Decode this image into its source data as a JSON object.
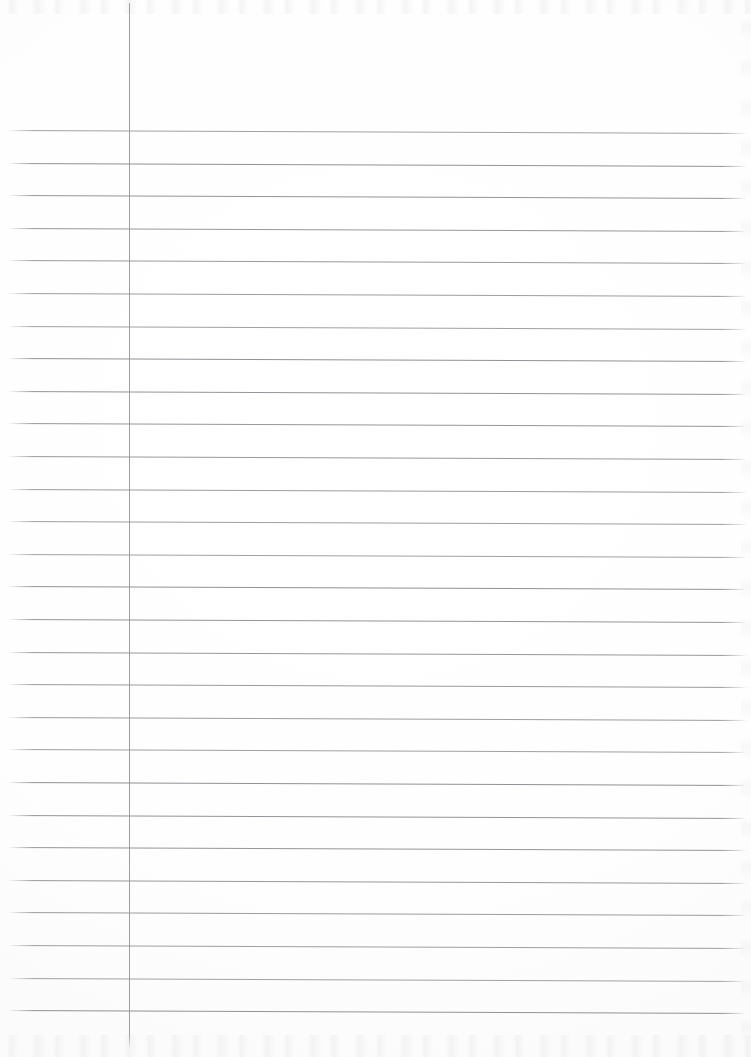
{
  "document": {
    "kind": "lined-notebook-paper",
    "title": "Blank lined paper sheet",
    "orientation": "portrait",
    "width_px": 751,
    "height_px": 1057,
    "visible_text": "",
    "handwriting_present": "no",
    "content_note": "Sheet is entirely blank — no writing, printing, numbers or marks of any kind."
  },
  "paper": {
    "background_color": "#fefefe",
    "edge_tone_color": "#f7f7f6",
    "surface_texture": "faint scanner noise at top and bottom edges"
  },
  "ruling": {
    "style": "wide ruled with single vertical left margin",
    "rule_color": "#8d8d93",
    "rule_thickness_px": 1,
    "line_count": 28,
    "line_spacing_px": 32.6,
    "first_line_y": 130,
    "last_line_y": 1011,
    "line_start_x": 8,
    "line_end_x": 747,
    "skew_degrees": 0.24,
    "line_positions_y": [
      130,
      162.6,
      195.2,
      227.8,
      260.4,
      293,
      325.6,
      358.2,
      390.8,
      423.4,
      456,
      488.6,
      521.2,
      553.8,
      586.4,
      619,
      651.6,
      684.2,
      716.8,
      749.4,
      782,
      814.6,
      847.2,
      879.8,
      912.4,
      945,
      977.6,
      1010.2
    ]
  },
  "margin_rule": {
    "orientation": "vertical",
    "color": "#92929a",
    "thickness_px": 1,
    "x": 129,
    "top_y": 3,
    "bottom_y": 1050,
    "left_column_width_px": 129
  },
  "regions": {
    "header_label": "unruled header area above first line",
    "margin_label": "left margin column",
    "writing_label": "main ruled writing area"
  }
}
